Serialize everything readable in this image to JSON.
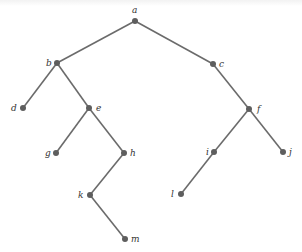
{
  "diagram": {
    "type": "rooted-tree",
    "root": "a",
    "colors": {
      "edge": "#6b6b6b",
      "node": "#5e5e5e",
      "label": "#333333"
    },
    "nodes": [
      {
        "id": "a",
        "label": "a",
        "x": 135,
        "y": 21,
        "lx": 132,
        "ly": 13
      },
      {
        "id": "b",
        "label": "b",
        "x": 57,
        "y": 63,
        "lx": 46,
        "ly": 66
      },
      {
        "id": "c",
        "label": "c",
        "x": 213,
        "y": 64,
        "lx": 219,
        "ly": 67
      },
      {
        "id": "d",
        "label": "d",
        "x": 23,
        "y": 108,
        "lx": 11,
        "ly": 111
      },
      {
        "id": "e",
        "label": "e",
        "x": 89,
        "y": 108,
        "lx": 96,
        "ly": 111
      },
      {
        "id": "f",
        "label": "f",
        "x": 249,
        "y": 109,
        "lx": 257,
        "ly": 112
      },
      {
        "id": "g",
        "label": "g",
        "x": 56,
        "y": 153,
        "lx": 45,
        "ly": 156
      },
      {
        "id": "h",
        "label": "h",
        "x": 124,
        "y": 153,
        "lx": 130,
        "ly": 156
      },
      {
        "id": "i",
        "label": "i",
        "x": 214,
        "y": 152,
        "lx": 206,
        "ly": 155
      },
      {
        "id": "j",
        "label": "j",
        "x": 283,
        "y": 152,
        "lx": 289,
        "ly": 155
      },
      {
        "id": "k",
        "label": "k",
        "x": 90,
        "y": 195,
        "lx": 78,
        "ly": 198
      },
      {
        "id": "l",
        "label": "l",
        "x": 181,
        "y": 194,
        "lx": 171,
        "ly": 197
      },
      {
        "id": "m",
        "label": "m",
        "x": 125,
        "y": 239,
        "lx": 131,
        "ly": 242
      }
    ],
    "edges": [
      [
        "a",
        "b"
      ],
      [
        "a",
        "c"
      ],
      [
        "b",
        "d"
      ],
      [
        "b",
        "e"
      ],
      [
        "e",
        "g"
      ],
      [
        "e",
        "h"
      ],
      [
        "h",
        "k"
      ],
      [
        "k",
        "m"
      ],
      [
        "c",
        "f"
      ],
      [
        "f",
        "i"
      ],
      [
        "f",
        "j"
      ],
      [
        "i",
        "l"
      ]
    ]
  }
}
